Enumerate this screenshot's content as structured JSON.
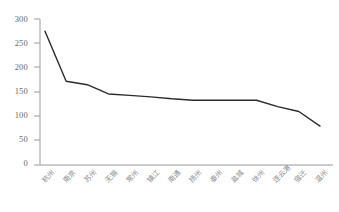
{
  "chart_data": {
    "type": "line",
    "title": "",
    "xlabel": "",
    "ylabel": "",
    "ylim": [
      0,
      300
    ],
    "ytick_step": 50,
    "grid": false,
    "legend": null,
    "line_color": "#2b2b2b",
    "axis_color": "#9a9a9a",
    "yticks": [
      "300",
      "250",
      "200",
      "150",
      "100",
      "50",
      "0"
    ],
    "ytick_values": [
      300,
      250,
      200,
      150,
      100,
      50,
      0
    ],
    "categories": [
      "杭州",
      "南京",
      "苏州",
      "无锡",
      "常州",
      "镇江",
      "南通",
      "扬州",
      "泰州",
      "盐城",
      "徐州",
      "连云港",
      "宿迁",
      "温州"
    ],
    "values": [
      275,
      172,
      165,
      146,
      143,
      140,
      136,
      133,
      133,
      133,
      133,
      120,
      110,
      80
    ],
    "series": [
      {
        "name": "series-1",
        "values": [
          275,
          172,
          165,
          146,
          143,
          140,
          136,
          133,
          133,
          133,
          133,
          120,
          110,
          80
        ]
      }
    ]
  },
  "axes": {
    "x_axis_name": "x-axis",
    "y_axis_name": "y-axis"
  }
}
